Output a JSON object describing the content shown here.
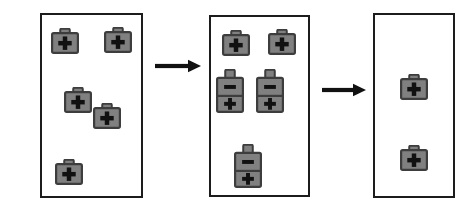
{
  "figure": {
    "type": "process-diagram",
    "title": "",
    "background_color": "#ffffff",
    "panel_border_color": "#1c1c1c",
    "icon_fill_color": "#808080",
    "icon_outline_color": "#3d3d3d",
    "icon_symbol_color": "#111111",
    "arrow_color": "#111111"
  },
  "panels": [
    {
      "name": "panel-1",
      "label": "",
      "x": 40,
      "y": 13,
      "w": 103,
      "h": 185,
      "icons": [
        {
          "name": "cell-single-1",
          "kind": "single",
          "symbol_top": "",
          "symbol_bottom": "+",
          "x": 51,
          "y": 28,
          "w": 28,
          "h": 26
        },
        {
          "name": "cell-single-2",
          "kind": "single",
          "symbol_top": "",
          "symbol_bottom": "+",
          "x": 104,
          "y": 27,
          "w": 28,
          "h": 26
        },
        {
          "name": "cell-single-3",
          "kind": "single",
          "symbol_top": "",
          "symbol_bottom": "+",
          "x": 64,
          "y": 87,
          "w": 28,
          "h": 26
        },
        {
          "name": "cell-single-4",
          "kind": "single",
          "symbol_top": "",
          "symbol_bottom": "+",
          "x": 93,
          "y": 103,
          "w": 28,
          "h": 26
        },
        {
          "name": "cell-single-5",
          "kind": "single",
          "symbol_top": "",
          "symbol_bottom": "+",
          "x": 55,
          "y": 159,
          "w": 28,
          "h": 26
        }
      ]
    },
    {
      "name": "panel-2",
      "label": "",
      "x": 209,
      "y": 15,
      "w": 101,
      "h": 182,
      "icons": [
        {
          "name": "cell-single-6",
          "kind": "single",
          "symbol_top": "",
          "symbol_bottom": "+",
          "x": 222,
          "y": 30,
          "w": 28,
          "h": 26
        },
        {
          "name": "cell-single-7",
          "kind": "single",
          "symbol_top": "",
          "symbol_bottom": "+",
          "x": 268,
          "y": 29,
          "w": 28,
          "h": 26
        },
        {
          "name": "cell-double-1",
          "kind": "double",
          "symbol_top": "−",
          "symbol_bottom": "+",
          "x": 216,
          "y": 69,
          "w": 28,
          "h": 44
        },
        {
          "name": "cell-double-2",
          "kind": "double",
          "symbol_top": "−",
          "symbol_bottom": "+",
          "x": 256,
          "y": 69,
          "w": 28,
          "h": 44
        },
        {
          "name": "cell-double-3",
          "kind": "double",
          "symbol_top": "−",
          "symbol_bottom": "+",
          "x": 234,
          "y": 144,
          "w": 28,
          "h": 44
        }
      ]
    },
    {
      "name": "panel-3",
      "label": "",
      "x": 373,
      "y": 13,
      "w": 82,
      "h": 185,
      "icons": [
        {
          "name": "cell-single-8",
          "kind": "single",
          "symbol_top": "",
          "symbol_bottom": "+",
          "x": 400,
          "y": 74,
          "w": 28,
          "h": 26
        },
        {
          "name": "cell-single-9",
          "kind": "single",
          "symbol_top": "",
          "symbol_bottom": "+",
          "x": 400,
          "y": 145,
          "w": 28,
          "h": 26
        }
      ]
    }
  ],
  "arrows": [
    {
      "name": "arrow-1",
      "x": 155,
      "y": 58,
      "w": 46,
      "h": 16,
      "direction": "right"
    },
    {
      "name": "arrow-2",
      "x": 322,
      "y": 82,
      "w": 44,
      "h": 16,
      "direction": "right"
    }
  ],
  "counts": {
    "panel_1_single": 5,
    "panel_1_double": 0,
    "panel_2_single": 2,
    "panel_2_double": 3,
    "panel_3_single": 2,
    "panel_3_double": 0
  }
}
